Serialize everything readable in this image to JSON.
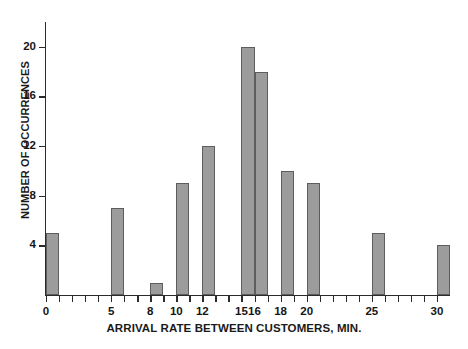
{
  "chart_data": {
    "type": "bar",
    "title": "",
    "xlabel": "ARRIVAL RATE BETWEEN CUSTOMERS, MIN.",
    "ylabel": "NUMBER OF OCCURRENCES",
    "categories": [
      0,
      5,
      8,
      10,
      12,
      15,
      16,
      18,
      20,
      25,
      30
    ],
    "values": [
      5,
      7,
      1,
      9,
      12,
      20,
      18,
      10,
      9,
      5,
      4
    ],
    "xlim": [
      0,
      31
    ],
    "ylim": [
      0,
      22
    ],
    "x_tick_labels": [
      "0",
      "5",
      "8",
      "10",
      "12",
      "15",
      "16",
      "18",
      "20",
      "25",
      "30"
    ],
    "x_tick_values": [
      0,
      5,
      8,
      10,
      12,
      15,
      16,
      18,
      20,
      25,
      30
    ],
    "x_minor_tick_values": [
      1,
      2,
      3,
      4,
      6,
      7,
      9,
      11,
      13,
      14,
      17,
      19,
      21,
      22,
      23,
      24,
      26,
      27,
      28,
      29
    ],
    "y_tick_labels": [
      "4",
      "8",
      "12",
      "16",
      "20"
    ],
    "y_tick_values": [
      4,
      8,
      12,
      16,
      20
    ],
    "grid": false,
    "legend": null,
    "bar_color": "#9c9c9c",
    "bar_edge_color": "#5d5d5d",
    "axis_color": "#2b2b2b",
    "background_color": "#ffffff"
  }
}
